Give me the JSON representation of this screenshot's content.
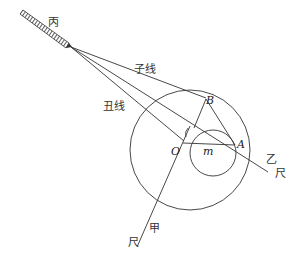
{
  "diagram": {
    "labels": {
      "telescope": "丙",
      "line_zi": "子线",
      "line_chou": "丑线",
      "point_B": "B",
      "point_O": "O",
      "point_A": "A",
      "segment_m": "m",
      "ruler_yi_name": "乙",
      "ruler_yi_char": "尺",
      "ruler_jia_name": "甲",
      "ruler_jia_char": "尺"
    },
    "colors": {
      "stroke": "#333333",
      "background": "#ffffff"
    }
  }
}
